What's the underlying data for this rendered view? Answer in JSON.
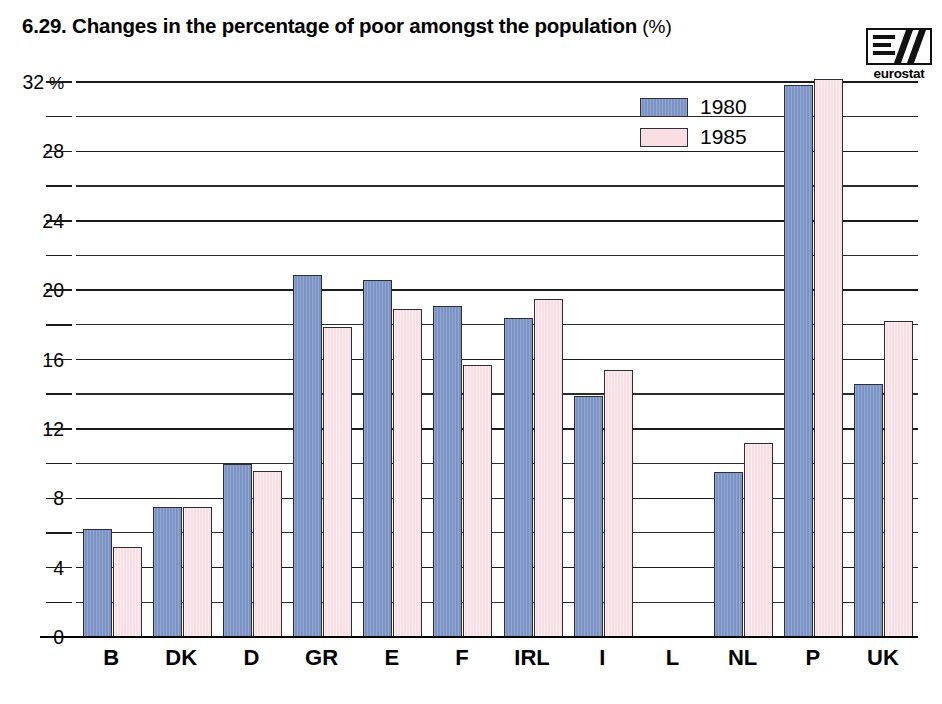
{
  "header": {
    "title": "6.29.  Changes in the percentage of poor amongst the population",
    "unit": "(%)",
    "logo_text": "eurostat",
    "logo_name": "eurostat-logo"
  },
  "legend": {
    "position": "top-right-inside",
    "entries": [
      {
        "label": "1980",
        "color": "#7b93c4"
      },
      {
        "label": "1985",
        "color": "#fbdde4"
      }
    ]
  },
  "axis": {
    "y_unit_suffix": "%",
    "y_ticks": [
      "32",
      "28",
      "24",
      "20",
      "16",
      "12",
      "8",
      "4",
      "0"
    ],
    "y_tick_values": [
      32,
      28,
      24,
      20,
      16,
      12,
      8,
      4,
      0
    ],
    "gridline_values": [
      32,
      30,
      28,
      26,
      24,
      22,
      20,
      18,
      16,
      14,
      12,
      10,
      8,
      6,
      4,
      2,
      0
    ]
  },
  "chart_data": {
    "type": "bar",
    "xlabel": "",
    "ylabel": "%",
    "ylim": [
      0,
      32
    ],
    "grid": true,
    "legend_position": "top-right",
    "categories": [
      "B",
      "DK",
      "D",
      "GR",
      "E",
      "F",
      "IRL",
      "I",
      "L",
      "NL",
      "P",
      "UK"
    ],
    "series": [
      {
        "name": "1980",
        "color": "#7b93c4",
        "values": [
          6.2,
          7.5,
          10.0,
          20.9,
          20.6,
          19.1,
          18.4,
          13.9,
          null,
          9.5,
          31.8,
          14.6
        ]
      },
      {
        "name": "1985",
        "color": "#fbdde4",
        "values": [
          5.2,
          7.5,
          9.6,
          17.9,
          18.9,
          15.7,
          19.5,
          15.4,
          null,
          11.2,
          32.2,
          18.2
        ]
      }
    ]
  }
}
